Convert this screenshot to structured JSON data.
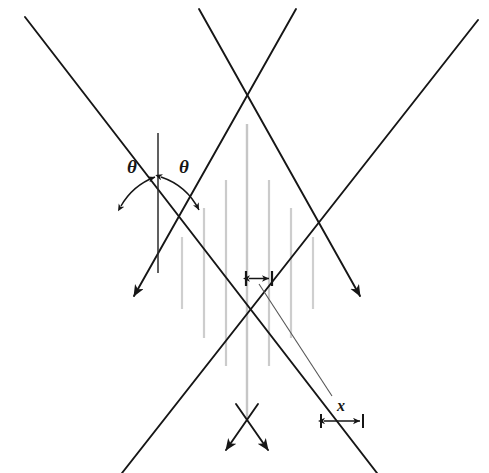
{
  "figure": {
    "type": "line-diagram",
    "width": 489,
    "height": 473,
    "background_color": "#ffffff",
    "line_color": "#1a1a1a",
    "hatch_color": "#c8c8c8",
    "leader_color": "#4a4a4a"
  },
  "labels": {
    "theta_left": "θ",
    "theta_right": "θ",
    "spacing_x": "x"
  },
  "annotations": {
    "theta_left_pos": {
      "x": 127,
      "y": 159
    },
    "theta_right_pos": {
      "x": 179,
      "y": 159
    },
    "x_label_pos": {
      "x": 336,
      "y": 400
    }
  },
  "geometry": {
    "description": "Two pairs of crossing straight rays forming a central diamond-shaped interference region filled with vertical fringe lines.",
    "beams": [
      {
        "name": "beam-down-right-outer",
        "x1": 25,
        "y1": 17,
        "x2": 375,
        "y2": 473
      },
      {
        "name": "beam-down-left-inner",
        "x1": 478,
        "y1": 20,
        "x2": 128,
        "y2": 473
      },
      {
        "name": "beam-down-right-inner",
        "x1": 200,
        "y1": 10,
        "x2": 375,
        "y2": 300
      },
      {
        "name": "beam-down-left-outer",
        "x1": 295,
        "y1": 10,
        "x2": 120,
        "y2": 300
      }
    ],
    "vertices": {
      "top_crossing": {
        "x": 247,
        "y": 118
      },
      "left_crossing": {
        "x": 158,
        "y": 268
      },
      "right_crossing": {
        "x": 336,
        "y": 268
      },
      "bottom_crossing": {
        "x": 247,
        "y": 423
      }
    },
    "bisector": {
      "x1": 158,
      "y1": 133,
      "x2": 158,
      "y2": 272
    },
    "arrowheads": [
      {
        "name": "arrow-lower-left",
        "x": 128,
        "y": 302,
        "angle_deg": 128
      },
      {
        "name": "arrow-lower-right",
        "x": 366,
        "y": 302,
        "angle_deg": 52
      },
      {
        "name": "arrow-bottom-left",
        "x": 222,
        "y": 455,
        "angle_deg": 128
      },
      {
        "name": "arrow-bottom-right",
        "x": 272,
        "y": 455,
        "angle_deg": 52
      }
    ],
    "fringe_lines_x": [
      182,
      204,
      226,
      247,
      269,
      291,
      313
    ],
    "fringe_span_y": {
      "top": 118,
      "bottom": 423
    },
    "spacing_bracket": {
      "x1": 246,
      "x2": 272,
      "y": 278
    },
    "leader_line": {
      "x1": 259,
      "y1": 283,
      "x2": 331,
      "y2": 394
    },
    "scale_bar": {
      "x1": 320,
      "x2": 363,
      "y": 421,
      "tick_half_height": 7
    },
    "angle_arcs": {
      "apex": {
        "x": 158,
        "y": 177
      },
      "radius": 66,
      "left_start_deg": 236,
      "left_end_deg": 270,
      "right_start_deg": 270,
      "right_end_deg": 305
    }
  }
}
